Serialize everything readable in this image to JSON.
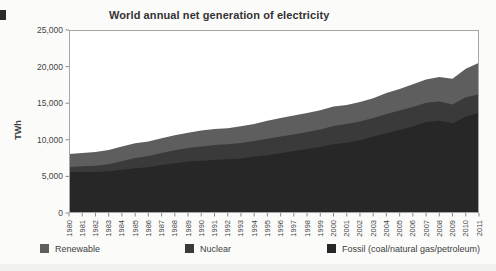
{
  "title": "World annual net generation of electricity",
  "ylabel": "TWh",
  "colors": {
    "fossil": "#272727",
    "nuclear": "#3a3a3a",
    "renewable": "#5e5e5e",
    "axis_border": "#a6a6a6",
    "tick": "#8a8a8a",
    "tick_text": "#454545",
    "plot_background": "#ffffff"
  },
  "legend": [
    {
      "label": "Renewable",
      "color": "#5e5e5e"
    },
    {
      "label": "Nuclear",
      "color": "#3a3a3a"
    },
    {
      "label": "Fossil (coal/natural gas/petroleum)",
      "color": "#272727"
    }
  ],
  "chart_data": {
    "type": "area",
    "stacked": true,
    "title": "World annual net generation of electricity",
    "xlabel": "",
    "ylabel": "TWh",
    "grid": false,
    "legend_position": "bottom",
    "ylim": [
      0,
      25000
    ],
    "ytick_values": [
      0,
      5000,
      10000,
      15000,
      20000,
      25000
    ],
    "ytick_labels": [
      "0",
      "5,000",
      "10,000",
      "15,000",
      "20,000",
      "25,000"
    ],
    "x": [
      1980,
      1981,
      1982,
      1983,
      1984,
      1985,
      1986,
      1987,
      1988,
      1989,
      1990,
      1991,
      1992,
      1993,
      1994,
      1995,
      1996,
      1997,
      1998,
      1999,
      2000,
      2001,
      2002,
      2003,
      2004,
      2005,
      2006,
      2007,
      2008,
      2009,
      2010,
      2011
    ],
    "series": [
      {
        "name": "Fossil (coal/natural gas/petroleum)",
        "color": "#272727",
        "values": [
          5600,
          5600,
          5600,
          5700,
          5900,
          6100,
          6250,
          6550,
          6800,
          7050,
          7150,
          7250,
          7350,
          7450,
          7700,
          7900,
          8150,
          8450,
          8750,
          9000,
          9400,
          9600,
          9950,
          10450,
          10900,
          11350,
          11800,
          12450,
          12600,
          12250,
          13150,
          13700
        ]
      },
      {
        "name": "Nuclear",
        "color": "#3a3a3a",
        "values": [
          700,
          780,
          850,
          950,
          1180,
          1430,
          1530,
          1650,
          1780,
          1850,
          1950,
          2020,
          2030,
          2100,
          2150,
          2230,
          2300,
          2290,
          2330,
          2400,
          2470,
          2540,
          2570,
          2540,
          2640,
          2650,
          2680,
          2620,
          2620,
          2580,
          2650,
          2530
        ]
      },
      {
        "name": "Renewable",
        "color": "#5e5e5e",
        "values": [
          1750,
          1800,
          1880,
          1950,
          2000,
          2000,
          2000,
          2000,
          2030,
          2050,
          2150,
          2200,
          2200,
          2300,
          2300,
          2480,
          2530,
          2570,
          2590,
          2630,
          2680,
          2600,
          2650,
          2680,
          2850,
          2950,
          3100,
          3150,
          3350,
          3500,
          3900,
          4300
        ]
      }
    ]
  }
}
